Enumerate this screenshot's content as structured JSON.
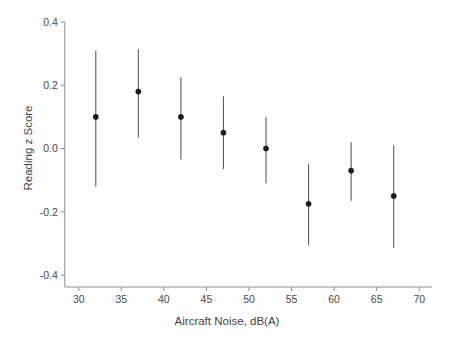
{
  "chart_data": {
    "type": "scatter",
    "title": "",
    "xlabel": "Aircraft Noise, dB(A)",
    "ylabel": "Reading z Score",
    "xlim": [
      28.5,
      71.5
    ],
    "ylim": [
      -0.47,
      0.45
    ],
    "xticks": [
      30,
      35,
      40,
      45,
      50,
      55,
      60,
      65,
      70
    ],
    "xticklabels": [
      "30",
      "35",
      "40",
      "45",
      "50",
      "55",
      "60",
      "65",
      "70"
    ],
    "yticks": [
      -0.4,
      -0.2,
      0.0,
      0.2,
      0.4
    ],
    "yticklabels": [
      "-0.4",
      "-0.2",
      "0.0",
      "0.2",
      "0.4"
    ],
    "grid": false,
    "legend": false,
    "error_bars": "vertical, no caps",
    "x": [
      32,
      37,
      42,
      47,
      52,
      57,
      62,
      67
    ],
    "values": [
      0.1,
      0.18,
      0.1,
      0.05,
      0.0,
      -0.175,
      -0.07,
      -0.15
    ],
    "err_low": [
      -0.12,
      0.035,
      -0.035,
      -0.065,
      -0.11,
      -0.305,
      -0.165,
      -0.315
    ],
    "err_high": [
      0.31,
      0.315,
      0.225,
      0.165,
      0.1,
      -0.05,
      0.02,
      0.01
    ],
    "series": [
      {
        "name": "Reading z Score",
        "points": [
          {
            "x": 32,
            "y": 0.1,
            "lo": -0.12,
            "hi": 0.31
          },
          {
            "x": 37,
            "y": 0.18,
            "lo": 0.035,
            "hi": 0.315
          },
          {
            "x": 42,
            "y": 0.1,
            "lo": -0.035,
            "hi": 0.225
          },
          {
            "x": 47,
            "y": 0.05,
            "lo": -0.065,
            "hi": 0.165
          },
          {
            "x": 52,
            "y": 0.0,
            "lo": -0.11,
            "hi": 0.1
          },
          {
            "x": 57,
            "y": -0.175,
            "lo": -0.305,
            "hi": -0.05
          },
          {
            "x": 62,
            "y": -0.07,
            "lo": -0.165,
            "hi": 0.02
          },
          {
            "x": 67,
            "y": -0.15,
            "lo": -0.315,
            "hi": 0.01
          }
        ]
      }
    ],
    "colors": {
      "marker": "#1b1b1b",
      "errorbar": "#555555",
      "axis": "#8d8d8d",
      "text": "#444444",
      "background": "#fefefe"
    }
  }
}
